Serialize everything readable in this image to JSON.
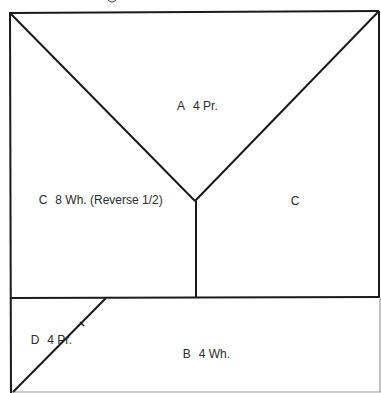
{
  "diagram": {
    "type": "quilt-block-pattern-layout",
    "line_color": "#1a1a1a",
    "faint_line_color": "#9a9a9a",
    "background": "#ffffff",
    "pieces": [
      {
        "id": "A",
        "letter": "A",
        "spec": "4 Pr.",
        "region": "top triangle"
      },
      {
        "id": "C-left",
        "letter": "C",
        "spec": "8 Wh. (Reverse 1/2)",
        "region": "left trapezoid"
      },
      {
        "id": "C-right",
        "letter": "C",
        "spec": "",
        "region": "right trapezoid"
      },
      {
        "id": "D",
        "letter": "D",
        "spec": "4 Pr.",
        "region": "bottom-left triangle"
      },
      {
        "id": "B",
        "letter": "B",
        "spec": "4 Wh.",
        "region": "bottom rectangle"
      }
    ]
  },
  "labels": {
    "a": {
      "letter": "A",
      "spec": "4 Pr."
    },
    "c_left": {
      "letter": "C",
      "spec": "8 Wh. (Reverse 1/2)"
    },
    "c_right": {
      "letter": "C"
    },
    "d": {
      "letter": "D",
      "spec": "4 Pr."
    },
    "b": {
      "letter": "B",
      "spec": "4 Wh."
    }
  }
}
